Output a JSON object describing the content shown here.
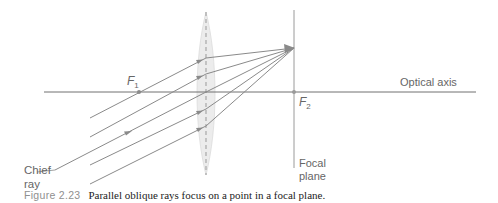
{
  "diagram": {
    "labels": {
      "f1": "F",
      "f1_sub": "1",
      "f2": "F",
      "f2_sub": "2",
      "optical_axis": "Optical axis",
      "chief_ray_line1": "Chief",
      "chief_ray_line2": "ray",
      "focal_plane_line1": "Focal",
      "focal_plane_line2": "plane"
    },
    "caption": {
      "figure_number": "Figure 2.23",
      "text": "Parallel oblique rays focus on a point in a focal plane."
    },
    "colors": {
      "ray": "#8a8a8a",
      "axis": "#707070",
      "lens_fill": "#ececec",
      "lens_dash": "#999999",
      "text": "#666666"
    },
    "geometry": {
      "lens_x": 206,
      "lens_top": 12,
      "lens_bottom": 175,
      "axis_y": 92,
      "focal_point": [
        294,
        48
      ],
      "f1": [
        139,
        92
      ],
      "f2": [
        294,
        92
      ],
      "rays": [
        {
          "start": [
            90,
            118
          ],
          "lens": [
            206,
            58
          ]
        },
        {
          "start": [
            90,
            137
          ],
          "lens": [
            206,
            74
          ]
        },
        {
          "start": [
            55,
            170
          ],
          "lens": [
            206,
            92
          ],
          "chief": true
        },
        {
          "start": [
            90,
            165
          ],
          "lens": [
            206,
            109
          ]
        },
        {
          "start": [
            90,
            184
          ],
          "lens": [
            206,
            126
          ]
        }
      ]
    }
  }
}
